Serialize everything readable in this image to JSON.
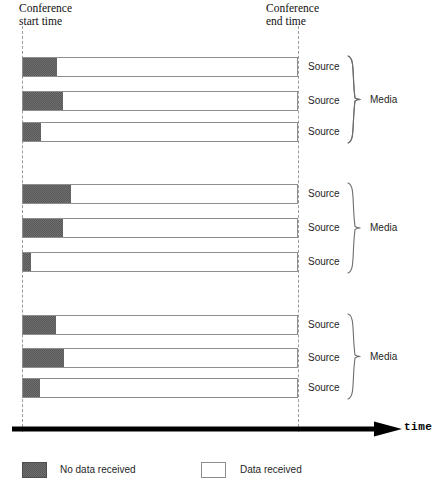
{
  "figure": {
    "axis": {
      "label": "time",
      "arrow_direction": "right"
    },
    "markers": {
      "start": "Conference\nstart time",
      "end": "Conference\nend time"
    },
    "legend": [
      {
        "key": "no-data",
        "label": "No data received",
        "color": "#595959"
      },
      {
        "key": "data",
        "label": "Data received",
        "color": "#ffffff"
      }
    ],
    "groups": [
      {
        "label": "Media",
        "rows": [
          {
            "label": "Source",
            "no_data_pct": 12.3,
            "data_pct": 87.7
          },
          {
            "label": "Source",
            "no_data_pct": 14.5,
            "data_pct": 85.5
          },
          {
            "label": "Source",
            "no_data_pct": 6.5,
            "data_pct": 93.5
          }
        ]
      },
      {
        "label": "Media",
        "rows": [
          {
            "label": "Source",
            "no_data_pct": 17.4,
            "data_pct": 82.6
          },
          {
            "label": "Source",
            "no_data_pct": 14.5,
            "data_pct": 85.5
          },
          {
            "label": "Source",
            "no_data_pct": 2.9,
            "data_pct": 97.1
          }
        ]
      },
      {
        "label": "Media",
        "rows": [
          {
            "label": "Source",
            "no_data_pct": 12.0,
            "data_pct": 88.0
          },
          {
            "label": "Source",
            "no_data_pct": 14.9,
            "data_pct": 85.1
          },
          {
            "label": "Source",
            "no_data_pct": 6.2,
            "data_pct": 93.8
          }
        ]
      }
    ]
  },
  "chart_data": {
    "type": "bar",
    "orientation": "horizontal",
    "stacked": true,
    "title": "",
    "xlabel": "time",
    "ylabel": "",
    "grid": false,
    "legend_position": "bottom",
    "xlim": [
      0,
      100
    ],
    "x_annotations": [
      {
        "value": 0,
        "label": "Conference start time"
      },
      {
        "value": 100,
        "label": "Conference end time"
      }
    ],
    "categories": [
      "Media 1 / Source 1",
      "Media 1 / Source 2",
      "Media 1 / Source 3",
      "Media 2 / Source 1",
      "Media 2 / Source 2",
      "Media 2 / Source 3",
      "Media 3 / Source 1",
      "Media 3 / Source 2",
      "Media 3 / Source 3"
    ],
    "series": [
      {
        "name": "No data received",
        "color": "#595959",
        "values": [
          12.3,
          14.5,
          6.5,
          17.4,
          14.5,
          2.9,
          12.0,
          14.9,
          6.2
        ]
      },
      {
        "name": "Data received",
        "color": "#ffffff",
        "values": [
          87.7,
          85.5,
          93.5,
          82.6,
          85.5,
          97.1,
          88.0,
          85.1,
          93.8
        ]
      }
    ],
    "units": "percent of conference duration"
  },
  "layout": {
    "bar_left_px": 22,
    "bar_width_px": 276,
    "bar_height_px": 20,
    "row_tops_px": [
      57,
      91,
      122,
      184,
      218,
      252,
      315,
      348,
      378
    ],
    "group_brace_spans_px": [
      [
        55,
        144
      ],
      [
        182,
        274
      ],
      [
        313,
        400
      ]
    ],
    "group_label_tops_px": [
      93,
      221,
      350
    ]
  }
}
